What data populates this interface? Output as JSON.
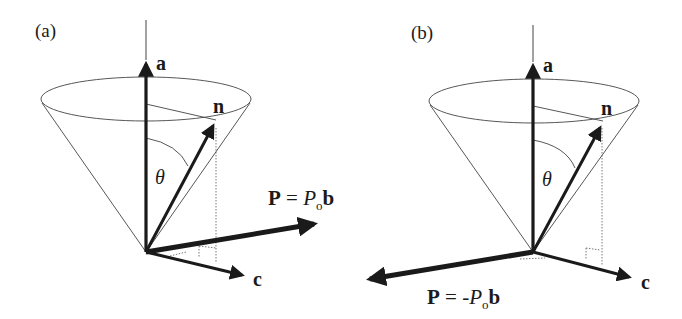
{
  "figure": {
    "panels": [
      {
        "id": "a",
        "label": "(a)",
        "vectors": {
          "a": "a",
          "n": "n",
          "c": "c",
          "theta": "θ",
          "P_label": {
            "lhs": "P",
            "eq": " = ",
            "coef": "P",
            "sub": "o",
            "vec": "b"
          }
        }
      },
      {
        "id": "b",
        "label": "(b)",
        "vectors": {
          "a": "a",
          "n": "n",
          "c": "c",
          "theta": "θ",
          "P_label": {
            "lhs": "P",
            "eq": " = -",
            "coef": "P",
            "sub": "o",
            "vec": "b"
          }
        }
      }
    ],
    "colors": {
      "ink": "#1a1a1a",
      "thin": "#444444",
      "background": "#ffffff"
    }
  }
}
